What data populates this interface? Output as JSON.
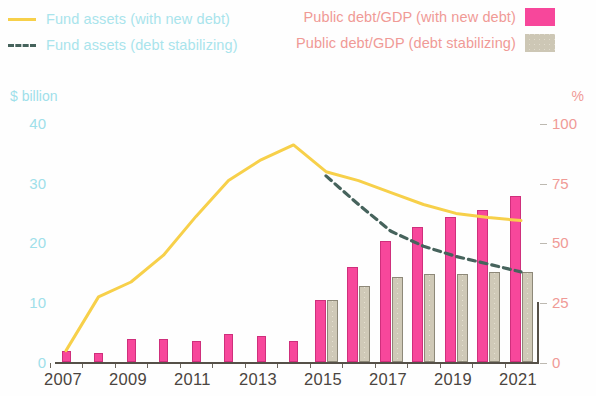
{
  "legend": {
    "left": [
      {
        "label": "Fund assets (with new debt)",
        "marker": "solid-line",
        "color": "#f7d04a"
      },
      {
        "label": "Fund assets (debt stabilizing)",
        "marker": "dashed-line",
        "color": "#46635c"
      }
    ],
    "right": [
      {
        "label": "Public debt/GDP (with new debt)",
        "marker": "pink-swatch",
        "color": "#f7479b"
      },
      {
        "label": "Public debt/GDP (debt stabilizing)",
        "marker": "gray-swatch",
        "color": "#cdc7b5"
      }
    ]
  },
  "axes": {
    "left_title": "$ billion",
    "right_title": "%",
    "left_ticks": [
      "40",
      "30",
      "20",
      "10",
      "0"
    ],
    "right_ticks": [
      "100",
      "75",
      "50",
      "25",
      "0"
    ],
    "x_labels": [
      "2007",
      "2009",
      "2011",
      "2013",
      "2015",
      "2017",
      "2019",
      "2021"
    ]
  },
  "chart_data": {
    "type": "bar",
    "title": "",
    "subtitle": "",
    "xlabel": "",
    "ylabel": "$ billion",
    "y2label": "%",
    "ylim": [
      0,
      40
    ],
    "y2lim": [
      0,
      100
    ],
    "grid": false,
    "legend_position": "top",
    "categories": [
      "2007",
      "2008",
      "2009",
      "2010",
      "2011",
      "2012",
      "2013",
      "2014",
      "2015",
      "2016",
      "2017",
      "2018",
      "2019",
      "2020",
      "2021"
    ],
    "x_tick_labels": [
      "2007",
      "2009",
      "2011",
      "2013",
      "2015",
      "2017",
      "2019",
      "2021"
    ],
    "series": [
      {
        "name": "Public debt/GDP (with new debt)",
        "type": "bar",
        "axis": "right",
        "unit": "%",
        "color": "#f7479b",
        "values": [
          5,
          4,
          10,
          10,
          9,
          12,
          11,
          9,
          26,
          40,
          51,
          57,
          61,
          64,
          70
        ]
      },
      {
        "name": "Public debt/GDP (debt stabilizing)",
        "type": "bar",
        "axis": "right",
        "unit": "%",
        "color": "#cdc7b5",
        "values": [
          null,
          null,
          null,
          null,
          null,
          null,
          null,
          null,
          26,
          32,
          36,
          37,
          37,
          38,
          38
        ]
      },
      {
        "name": "Fund assets (with new debt)",
        "type": "line",
        "axis": "left",
        "unit": "$ billion",
        "color": "#f7d04a",
        "style": "solid",
        "values": [
          2.0,
          11.0,
          13.5,
          18.0,
          24.5,
          30.5,
          34.0,
          36.5,
          32.0,
          30.5,
          28.5,
          26.5,
          25.0,
          24.3,
          23.8
        ]
      },
      {
        "name": "Fund assets (debt stabilizing)",
        "type": "line",
        "axis": "left",
        "unit": "$ billion",
        "color": "#46635c",
        "style": "dashed",
        "values": [
          null,
          null,
          null,
          null,
          null,
          null,
          null,
          null,
          31.3,
          26.5,
          22.0,
          19.5,
          17.8,
          16.5,
          15.2
        ]
      }
    ]
  }
}
